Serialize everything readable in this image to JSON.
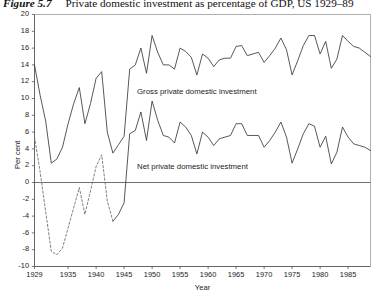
{
  "caption": {
    "figure_label": "Figure 5.7",
    "text": "Private domestic investment as percentage of GDP, US 1929–89"
  },
  "chart_data": {
    "type": "line",
    "title": "Private domestic investment as percentage of GDP, US 1929–89",
    "xlabel": "Year",
    "ylabel": "Per cent",
    "xlim": [
      1929,
      1989
    ],
    "ylim": [
      -10,
      20
    ],
    "grid": false,
    "legend": "inline-annotations",
    "yticks": [
      -10,
      -8,
      -6,
      -4,
      -2,
      0,
      2,
      4,
      6,
      8,
      10,
      12,
      14,
      16,
      18,
      20
    ],
    "ytick_labels": [
      "-10",
      "-8",
      "-6",
      "-4",
      "-2",
      "0",
      "2",
      "4",
      "6",
      "8",
      "10",
      "12",
      "14",
      "16",
      "18",
      "20"
    ],
    "xticks": [
      1929,
      1935,
      1940,
      1945,
      1950,
      1955,
      1960,
      1965,
      1970,
      1975,
      1980,
      1985
    ],
    "xtick_labels": [
      "1929",
      "1935",
      "1940",
      "1945",
      "1950",
      "1955",
      "1960",
      "1965",
      "1970",
      "1975",
      "1980",
      "1985"
    ],
    "x": [
      1929,
      1930,
      1931,
      1932,
      1933,
      1934,
      1935,
      1936,
      1937,
      1938,
      1939,
      1940,
      1941,
      1942,
      1943,
      1944,
      1945,
      1946,
      1947,
      1948,
      1949,
      1950,
      1951,
      1952,
      1953,
      1954,
      1955,
      1956,
      1957,
      1958,
      1959,
      1960,
      1961,
      1962,
      1963,
      1964,
      1965,
      1966,
      1967,
      1968,
      1969,
      1970,
      1971,
      1972,
      1973,
      1974,
      1975,
      1976,
      1977,
      1978,
      1979,
      1980,
      1981,
      1982,
      1983,
      1984,
      1985,
      1986,
      1987,
      1988,
      1989
    ],
    "series": [
      {
        "name": "Gross private domestic investment",
        "style": "solid",
        "color": "#3a3a3a",
        "annotation": "Gross private domestic investment",
        "values": [
          14.0,
          10.4,
          7.3,
          2.3,
          2.8,
          4.2,
          7.0,
          9.4,
          11.3,
          7.0,
          9.4,
          12.4,
          13.2,
          6.0,
          3.5,
          4.5,
          5.5,
          13.5,
          14.0,
          16.0,
          13.0,
          17.5,
          15.5,
          14.0,
          14.0,
          13.5,
          16.0,
          15.6,
          14.9,
          12.8,
          15.3,
          14.8,
          13.8,
          14.6,
          14.8,
          14.8,
          16.2,
          16.3,
          15.1,
          15.3,
          15.5,
          14.3,
          15.1,
          16.0,
          17.2,
          15.8,
          12.8,
          14.5,
          16.3,
          17.5,
          17.5,
          15.3,
          16.8,
          13.6,
          14.7,
          17.5,
          16.8,
          16.2,
          16.0,
          15.5,
          15.0
        ]
      },
      {
        "name": "Net private domestic investment",
        "style": "solid-with-dashed-negative-segment",
        "color": "#3a3a3a",
        "annotation": "Net private domestic investment",
        "values": [
          5.4,
          1.3,
          -3.5,
          -8.2,
          -8.6,
          -7.8,
          -5.4,
          -3.0,
          -0.6,
          -3.8,
          -1.0,
          1.9,
          3.3,
          -2.2,
          -4.6,
          -3.8,
          -2.4,
          5.8,
          6.2,
          8.4,
          5.0,
          9.7,
          7.4,
          5.6,
          5.4,
          4.7,
          7.2,
          6.6,
          5.6,
          3.4,
          6.0,
          5.4,
          4.4,
          5.2,
          5.4,
          5.6,
          7.0,
          7.0,
          5.6,
          5.6,
          5.6,
          4.2,
          5.0,
          6.0,
          7.2,
          5.4,
          2.3,
          4.0,
          5.8,
          7.0,
          6.7,
          4.2,
          5.5,
          2.2,
          3.6,
          6.6,
          5.4,
          4.6,
          4.4,
          4.2,
          3.8
        ]
      }
    ],
    "negative_dashed_range": [
      1930,
      1942
    ],
    "zero_line": 0
  },
  "series_annotations": {
    "gross": "Gross private domestic investment",
    "net": "Net private domestic investment"
  }
}
